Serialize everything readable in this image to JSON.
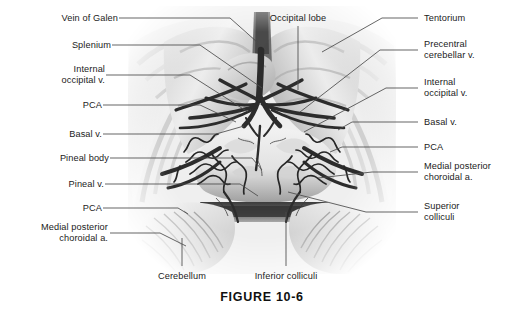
{
  "figure": {
    "caption": "FIGURE 10-6"
  },
  "labels": {
    "left": [
      {
        "id": "vein-of-galen",
        "text": "Vein of Galen"
      },
      {
        "id": "splenium",
        "text": "Splenium"
      },
      {
        "id": "internal-occipital-v",
        "text": "Internal\noccipital v."
      },
      {
        "id": "pca-upper",
        "text": "PCA"
      },
      {
        "id": "basal-v",
        "text": "Basal v."
      },
      {
        "id": "pineal-body",
        "text": "Pineal body"
      },
      {
        "id": "pineal-v",
        "text": "Pineal v."
      },
      {
        "id": "pca-lower",
        "text": "PCA"
      },
      {
        "id": "medial-posterior-choroidal-a",
        "text": "Medial posterior\nchoroidal a."
      }
    ],
    "right": [
      {
        "id": "tentorium",
        "text": "Tentorium"
      },
      {
        "id": "precentral-cerebellar-v",
        "text": "Precentral\ncerebellar v."
      },
      {
        "id": "internal-occipital-v",
        "text": "Internal\noccipital v."
      },
      {
        "id": "basal-v",
        "text": "Basal v."
      },
      {
        "id": "pca",
        "text": "PCA"
      },
      {
        "id": "medial-posterior-choroidal-a",
        "text": "Medial posterior\nchoroidal a."
      },
      {
        "id": "superior-colliculi",
        "text": "Superior\ncolliculi"
      }
    ],
    "top": [
      {
        "id": "occipital-lobe",
        "text": "Occipital lobe"
      }
    ],
    "bottom": [
      {
        "id": "cerebellum",
        "text": "Cerebellum"
      },
      {
        "id": "inferior-colliculi",
        "text": "Inferior colliculi"
      }
    ]
  },
  "colors": {
    "background": "#ffffff",
    "text": "#1b1b1b",
    "leader_line": "#4a4a4a",
    "vessel_dark": "#2e2e2e",
    "tissue_light": "#e8e8e8",
    "tissue_mid": "#b9b9b9",
    "tissue_shadow": "#7d7d7d",
    "cistern_dark": "#4f4f4f"
  }
}
